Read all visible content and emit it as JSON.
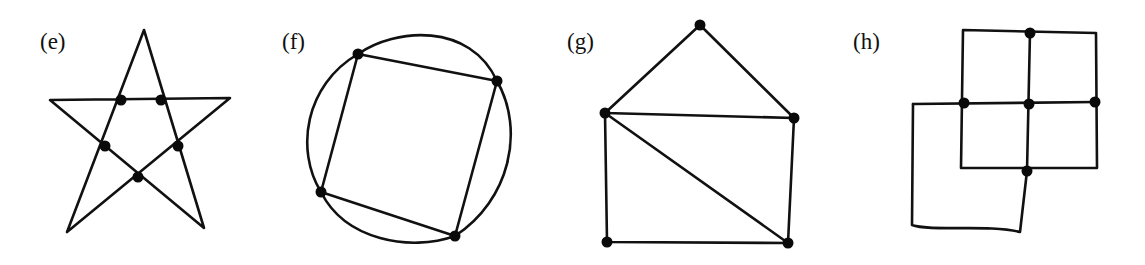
{
  "figures": [
    {
      "id": "e",
      "label": "(e)",
      "label_pos": [
        40,
        30
      ],
      "description": "five-pointed star with five marked interior intersection vertices",
      "paths": [
        "M 67 232 L 144 30 L 204 228 L 50 100 L 230 98 Z"
      ],
      "vertices": [
        [
          121,
          100
        ],
        [
          161,
          100
        ],
        [
          105,
          146
        ],
        [
          178,
          146
        ],
        [
          138,
          177
        ]
      ]
    },
    {
      "id": "f",
      "label": "(f)",
      "label_pos": [
        282,
        30
      ],
      "description": "quadrilateral inscribed in a circle, four marked vertices",
      "paths": [
        "M 358 54 L 497 81 L 455 236 L 321 192 Z",
        "M 358 54 C 395 28, 470 22, 497 81 C 525 130, 510 200, 455 236 C 410 252, 345 240, 321 192 C 295 150, 305 85, 358 54 Z"
      ],
      "vertices": [
        [
          358,
          54
        ],
        [
          497,
          81
        ],
        [
          455,
          236
        ],
        [
          321,
          192
        ]
      ]
    },
    {
      "id": "g",
      "label": "(g)",
      "label_pos": [
        567,
        30
      ],
      "description": "house shape: triangle roof over a rectangle with one diagonal",
      "paths": [
        "M 700 25 L 605 113 L 794 118 Z",
        "M 605 113 L 607 242 L 788 243 L 794 118",
        "M 605 113 L 788 243"
      ],
      "vertices": [
        [
          700,
          25
        ],
        [
          605,
          113
        ],
        [
          794,
          118
        ],
        [
          607,
          242
        ],
        [
          788,
          243
        ]
      ]
    },
    {
      "id": "h",
      "label": "(h)",
      "label_pos": [
        853,
        30
      ],
      "description": "2x2 grid of squares overlapping a larger square at lower left",
      "paths": [
        "M 963 30 L 1096 33 L 1097 168 L 961 168 Z",
        "M 1030 32 L 1027 171",
        "M 913 104 L 1095 102",
        "M 913 104 L 912 225 C 930 232, 990 224, 1020 232 L 1027 171"
      ],
      "vertices": [
        [
          1030,
          33
        ],
        [
          964,
          103
        ],
        [
          1029,
          104
        ],
        [
          1095,
          102
        ],
        [
          1027,
          171
        ]
      ]
    }
  ],
  "style": {
    "stroke_color": "#111111",
    "vertex_color": "#0a0a0a",
    "background": "#ffffff"
  }
}
